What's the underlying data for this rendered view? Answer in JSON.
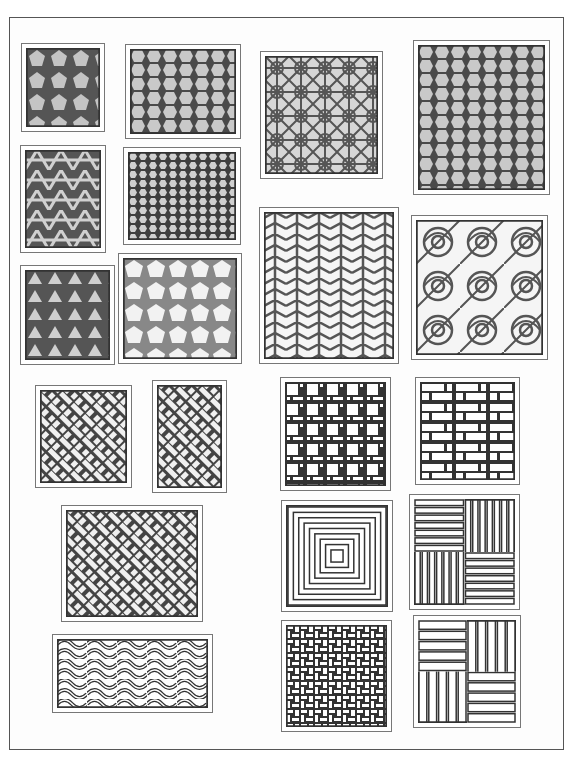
{
  "plate": {
    "description": "Scanned plate of lattice / window screen patterns",
    "ink_color": "#333333",
    "paper_color": "#ffffff",
    "fill_gray": "#b8b8b8"
  },
  "panels": [
    {
      "id": "pentagon-grid",
      "pattern": "pentagons",
      "x": 21,
      "y": 43,
      "w": 84,
      "h": 89,
      "tone": "dark"
    },
    {
      "id": "hexagon-grid-large",
      "pattern": "hexagons",
      "x": 125,
      "y": 44,
      "w": 116,
      "h": 95,
      "tone": "dark"
    },
    {
      "id": "star-rosette-grid",
      "pattern": "stars",
      "x": 260,
      "y": 51,
      "w": 123,
      "h": 128,
      "tone": "mid"
    },
    {
      "id": "octagon-hex-grid",
      "pattern": "hexagons",
      "x": 413,
      "y": 40,
      "w": 137,
      "h": 155,
      "tone": "dark"
    },
    {
      "id": "interlaced-triangles",
      "pattern": "interlace",
      "x": 20,
      "y": 145,
      "w": 86,
      "h": 108,
      "tone": "dark"
    },
    {
      "id": "hexagon-grid-small",
      "pattern": "hexsmall",
      "x": 123,
      "y": 147,
      "w": 118,
      "h": 98,
      "tone": "dark"
    },
    {
      "id": "star-of-david-grid",
      "pattern": "triangles",
      "x": 20,
      "y": 265,
      "w": 95,
      "h": 100,
      "tone": "dark"
    },
    {
      "id": "irregular-pentagons",
      "pattern": "pentagons",
      "x": 118,
      "y": 253,
      "w": 124,
      "h": 111,
      "tone": "light"
    },
    {
      "id": "chevron-star-grid",
      "pattern": "chevrons",
      "x": 259,
      "y": 207,
      "w": 140,
      "h": 157,
      "tone": "light"
    },
    {
      "id": "spiral-rose-grid",
      "pattern": "spirals",
      "x": 411,
      "y": 215,
      "w": 137,
      "h": 145,
      "tone": "light"
    },
    {
      "id": "basket-weave-small",
      "pattern": "weave",
      "x": 35,
      "y": 385,
      "w": 97,
      "h": 103,
      "tone": "dark"
    },
    {
      "id": "diagonal-weave-tall",
      "pattern": "weave",
      "x": 152,
      "y": 380,
      "w": 75,
      "h": 113,
      "tone": "dark"
    },
    {
      "id": "square-offset-grid",
      "pattern": "squares",
      "x": 280,
      "y": 377,
      "w": 111,
      "h": 114,
      "tone": "line"
    },
    {
      "id": "brick-offset-grid",
      "pattern": "bricks",
      "x": 415,
      "y": 377,
      "w": 105,
      "h": 108,
      "tone": "line"
    },
    {
      "id": "diagonal-weave-large",
      "pattern": "weave",
      "x": 61,
      "y": 505,
      "w": 142,
      "h": 117,
      "tone": "line"
    },
    {
      "id": "concentric-square-spiral",
      "pattern": "spiral-square",
      "x": 281,
      "y": 500,
      "w": 112,
      "h": 112,
      "tone": "line"
    },
    {
      "id": "pinwheel-lattice",
      "pattern": "pinwheel",
      "x": 409,
      "y": 494,
      "w": 111,
      "h": 116,
      "tone": "line"
    },
    {
      "id": "wave-weave",
      "pattern": "waves",
      "x": 52,
      "y": 634,
      "w": 161,
      "h": 79,
      "tone": "line"
    },
    {
      "id": "fret-key-grid",
      "pattern": "fret",
      "x": 281,
      "y": 620,
      "w": 111,
      "h": 112,
      "tone": "line"
    },
    {
      "id": "bamboo-weave-grid",
      "pattern": "bamboo",
      "x": 413,
      "y": 615,
      "w": 108,
      "h": 113,
      "tone": "line"
    }
  ]
}
